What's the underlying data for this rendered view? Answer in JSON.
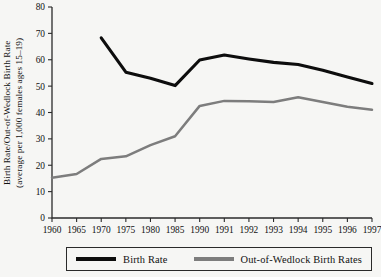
{
  "chart_data": {
    "type": "line",
    "title": "",
    "xlabel": "",
    "ylabel": "Birth Rate/Out-of-Wedlock Birth Rate (average per 1,000 females ages 15–19)",
    "ylabel_line1": "Birth Rate/Out-of-Wedlock Birth Rate",
    "ylabel_line2": "(average per 1,000 females ages 15–19)",
    "categories": [
      "1960",
      "1965",
      "1970",
      "1975",
      "1980",
      "1985",
      "1990",
      "1991",
      "1992",
      "1993",
      "1994",
      "1995",
      "1996",
      "1997"
    ],
    "ylim": [
      0,
      80
    ],
    "yticks": [
      0,
      10,
      20,
      30,
      40,
      50,
      60,
      70,
      80
    ],
    "ytick_labels": [
      "0",
      "10",
      "20",
      "30",
      "40",
      "50",
      "60",
      "70",
      "80"
    ],
    "grid": false,
    "legend_position": "bottom",
    "series": [
      {
        "name": "Birth Rate",
        "color": "#0d0d0d",
        "values": [
          null,
          null,
          68.3,
          55.3,
          53.0,
          50.2,
          59.9,
          61.8,
          60.3,
          59.0,
          58.2,
          56.0,
          53.5,
          51.0
        ]
      },
      {
        "name": "Out-of-Wedlock Birth Rates",
        "color": "#7d7d7d",
        "values": [
          15.3,
          16.7,
          22.4,
          23.4,
          27.6,
          31.0,
          42.5,
          44.4,
          44.3,
          44.0,
          45.8,
          44.0,
          42.2,
          41.0
        ]
      }
    ]
  },
  "legend": {
    "items": [
      {
        "label": "Birth Rate",
        "color": "#0d0d0d"
      },
      {
        "label": "Out-of-Wedlock Birth Rates",
        "color": "#7d7d7d"
      }
    ]
  },
  "axes": {
    "origin_x": 52,
    "origin_y": 218,
    "right_x": 372,
    "top_y": 7
  }
}
